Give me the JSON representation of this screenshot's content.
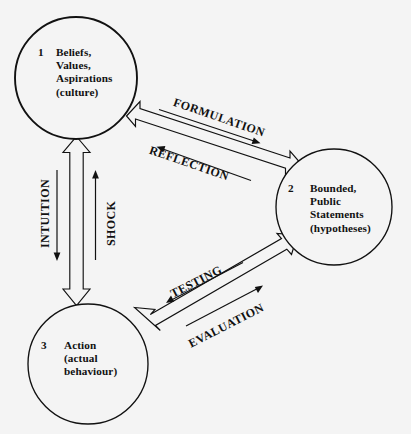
{
  "diagram": {
    "type": "cycle-diagram",
    "background_color": "#f4f4f4",
    "stroke_color": "#111111",
    "nodes": [
      {
        "id": "node-1",
        "number": "1",
        "lines": [
          "Beliefs,",
          "Values,",
          "Aspirations",
          "(culture)"
        ],
        "cx": 76,
        "cy": 78,
        "r": 61
      },
      {
        "id": "node-2",
        "number": "2",
        "lines": [
          "Bounded,",
          "Public",
          "Statements",
          "(hypotheses)"
        ],
        "cx": 334,
        "cy": 207,
        "r": 58
      },
      {
        "id": "node-3",
        "number": "3",
        "lines": [
          "Action",
          "(actual",
          "behaviour)"
        ],
        "cx": 88,
        "cy": 364,
        "r": 60
      }
    ],
    "edges": [
      {
        "id": "edge-1-2",
        "from": "node-1",
        "to": "node-2",
        "labels": [
          {
            "text": "FORMULATION",
            "direction": "to-node-2"
          },
          {
            "text": "REFLECTION",
            "direction": "to-node-1"
          }
        ]
      },
      {
        "id": "edge-2-3",
        "from": "node-2",
        "to": "node-3",
        "labels": [
          {
            "text": "TESTING",
            "direction": "to-node-3"
          },
          {
            "text": "EVALUATION",
            "direction": "to-node-2"
          }
        ]
      },
      {
        "id": "edge-1-3",
        "from": "node-1",
        "to": "node-3",
        "labels": [
          {
            "text": "INTUITION",
            "direction": "to-node-3"
          },
          {
            "text": "SHOCK",
            "direction": "to-node-1"
          }
        ]
      }
    ]
  }
}
